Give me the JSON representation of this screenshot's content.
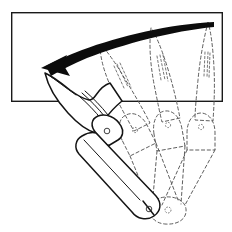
{
  "figure": {
    "title": "Folding pocket knife blade rotation diagram",
    "background_color": "#ffffff",
    "ink_color": "#141414",
    "ghost_color": "#555555",
    "frame_color": "#1a1a1a",
    "arrow_color": "#0c0c0c",
    "width": 232,
    "height": 232
  },
  "frame": {
    "name": "reference-rectangle",
    "x": 11,
    "y": 12,
    "width": 212,
    "height": 90,
    "stroke_width": 1.4
  },
  "arrow": {
    "name": "rotation-arrow",
    "direction": "counter-clockwise",
    "tip_x": 42,
    "tip_y": 68,
    "tail_x": 214,
    "tail_y": 22,
    "head_length": 20
  },
  "knife_solid": {
    "name": "knife-open-position",
    "style": "solid",
    "blade_tip_x": 45,
    "blade_tip_y": 73,
    "pivot_x": 170,
    "pivot_y": 210,
    "bolster_x": 107,
    "bolster_y": 140,
    "nail_nick_marks": 3
  },
  "knife_ghosts": [
    {
      "name": "knife-ghost-position-1",
      "style": "dashed",
      "angle_label": "intermediate",
      "blade_tip_x": 100,
      "blade_tip_y": 45,
      "bolster_x": 135,
      "bolster_y": 128
    },
    {
      "name": "knife-ghost-position-2",
      "style": "dashed",
      "angle_label": "intermediate",
      "blade_tip_x": 151,
      "blade_tip_y": 28,
      "bolster_x": 168,
      "bolster_y": 124
    },
    {
      "name": "knife-ghost-position-3",
      "style": "dashed",
      "angle_label": "closed-start",
      "blade_tip_x": 208,
      "blade_tip_y": 22,
      "bolster_x": 200,
      "bolster_y": 122
    }
  ],
  "pivot": {
    "name": "blade-pivot-point",
    "x": 170,
    "y": 210,
    "radius": 3
  }
}
